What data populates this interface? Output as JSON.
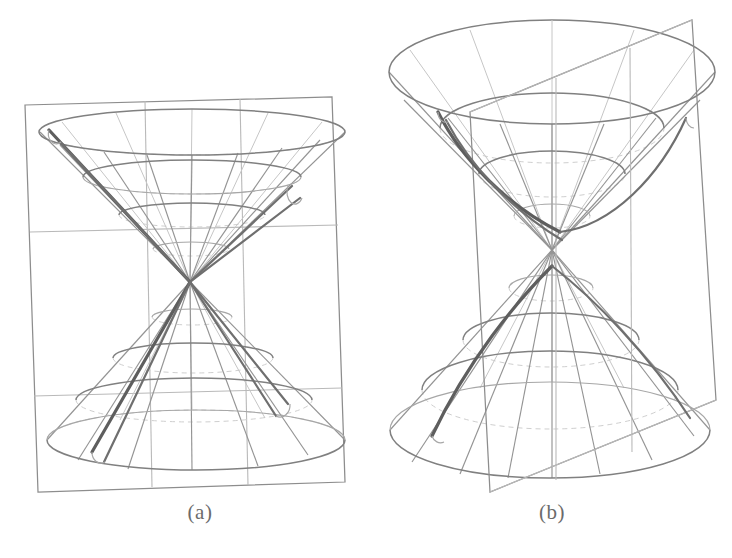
{
  "page": {
    "width": 732,
    "height": 558,
    "background": "#ffffff",
    "kind": "figure-pair"
  },
  "colors": {
    "line": "#8d8d8d",
    "line_light": "#c6c6c6",
    "line_hidden": "#cfcfcf",
    "accent": "#5e5e5e",
    "caption": "#6b6b6b",
    "background": "#ffffff"
  },
  "figures": [
    {
      "id": "figure-a",
      "caption": "(a)",
      "caption_x": 200,
      "caption_y": 512,
      "description": "double cone cut by a vertical plane through the apex, producing a pair of intersecting straight lines",
      "plane": {
        "type": "vertical-rectangle",
        "corners": [
          [
            25,
            105
          ],
          [
            332,
            97
          ],
          [
            345,
            482
          ],
          [
            38,
            492
          ]
        ],
        "horizontal_rules_y": [
          232,
          396
        ],
        "vertical_rules_x": [
          145,
          240
        ]
      },
      "cone": {
        "apex": [
          190,
          282
        ],
        "top_ellipse": {
          "cx": 192,
          "cy": 132,
          "rx": 153,
          "ry": 23
        },
        "bottom_ellipse": {
          "cx": 196,
          "cy": 440,
          "rx": 149,
          "ry": 30
        },
        "latitude_rings_upper": [
          {
            "cx": 192,
            "cy": 177,
            "rx": 109,
            "ry": 17
          },
          {
            "cx": 192,
            "cy": 215,
            "rx": 73,
            "ry": 12
          },
          {
            "cx": 191,
            "cy": 249,
            "rx": 38,
            "ry": 7
          }
        ],
        "latitude_rings_lower": [
          {
            "cx": 192,
            "cy": 317,
            "rx": 40,
            "ry": 8
          },
          {
            "cx": 193,
            "cy": 358,
            "rx": 80,
            "ry": 15
          },
          {
            "cx": 194,
            "cy": 400,
            "rx": 118,
            "ry": 22
          }
        ],
        "generator_count": 12
      },
      "intersection": {
        "kind": "degenerate-pair-of-lines",
        "segments": [
          [
            [
              48,
              130
            ],
            [
              190,
              282
            ]
          ],
          [
            [
              190,
              282
            ],
            [
              93,
              452
            ]
          ],
          [
            [
              190,
              282
            ],
            [
              300,
              200
            ]
          ],
          [
            [
              190,
              282
            ],
            [
              290,
              405
            ]
          ]
        ]
      }
    },
    {
      "id": "figure-b",
      "caption": "(b)",
      "caption_x": 552,
      "caption_y": 512,
      "description": "double cone cut by an oblique plane, producing a hyperbola-like curved section",
      "plane": {
        "type": "tilted-quadrilateral",
        "corners": [
          [
            692,
            20
          ],
          [
            716,
            400
          ],
          [
            490,
            492
          ],
          [
            470,
            112
          ]
        ],
        "slant_edges": [
          [
            [
              470,
              112
            ],
            [
              692,
              20
            ]
          ],
          [
            [
              490,
              492
            ],
            [
              716,
              400
            ]
          ]
        ],
        "vertical_rules_x": [
          556,
          630
        ]
      },
      "cone": {
        "apex": [
          552,
          250
        ],
        "top_ellipse": {
          "cx": 552,
          "cy": 72,
          "rx": 163,
          "ry": 52
        },
        "bottom_ellipse": {
          "cx": 550,
          "cy": 430,
          "rx": 160,
          "ry": 48
        },
        "latitude_rings_upper": [
          {
            "cx": 552,
            "cy": 128,
            "rx": 112,
            "ry": 35
          },
          {
            "cx": 552,
            "cy": 174,
            "rx": 73,
            "ry": 23
          },
          {
            "cx": 552,
            "cy": 216,
            "rx": 38,
            "ry": 12
          }
        ],
        "latitude_rings_lower": [
          {
            "cx": 551,
            "cy": 288,
            "rx": 42,
            "ry": 13
          },
          {
            "cx": 551,
            "cy": 340,
            "rx": 88,
            "ry": 27
          },
          {
            "cx": 550,
            "cy": 390,
            "rx": 128,
            "ry": 39
          }
        ],
        "generator_count": 12
      },
      "intersection": {
        "kind": "hyperbola-branches",
        "upper_branch": [
          [
            432,
            102
          ],
          [
            452,
            150
          ],
          [
            500,
            200
          ],
          [
            560,
            232
          ],
          [
            625,
            208
          ],
          [
            668,
            150
          ],
          [
            684,
            112
          ]
        ],
        "lower_branch": [
          [
            428,
            434
          ],
          [
            470,
            352
          ],
          [
            520,
            300
          ],
          [
            552,
            268
          ],
          [
            600,
            300
          ],
          [
            650,
            352
          ],
          [
            690,
            414
          ]
        ]
      }
    }
  ]
}
